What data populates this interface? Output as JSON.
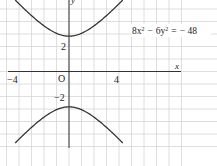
{
  "chart_data": {
    "type": "line",
    "title": "",
    "equation": "8x² − 6y² = −48",
    "equation_parts": {
      "a": "8x",
      "b": "6y",
      "rhs": "− 48",
      "minus": "−",
      "eq": "="
    },
    "xlabel": "x",
    "ylabel": "y",
    "origin_label": "O",
    "x_ticks": [
      {
        "value": -4,
        "label": "−4"
      },
      {
        "value": 4,
        "label": "4"
      }
    ],
    "y_ticks": [
      {
        "value": 2,
        "label": "2"
      },
      {
        "value": -2,
        "label": "−2"
      }
    ],
    "xlim": [
      -5.3,
      8.9
    ],
    "ylim": [
      -7.6,
      5.7
    ],
    "grid": true,
    "series": [
      {
        "name": "upper branch",
        "equation": "y = sqrt((8x^2+48)/6)",
        "vertex": [
          0,
          2.83
        ]
      },
      {
        "name": "lower branch",
        "equation": "y = -sqrt((8x^2+48)/6)",
        "vertex": [
          0,
          -2.83
        ]
      }
    ],
    "colors": {
      "curve": "#333333",
      "grid": "#d6d6d6",
      "axis": "#333333"
    }
  }
}
